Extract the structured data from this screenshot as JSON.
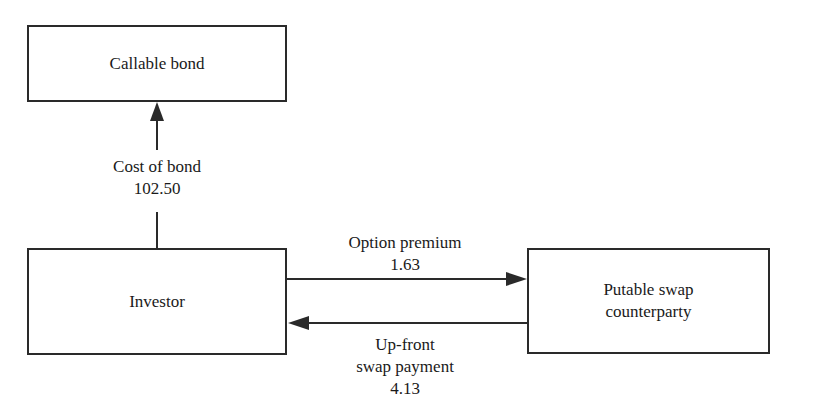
{
  "diagram": {
    "nodes": {
      "callable_bond": {
        "label": "Callable bond"
      },
      "investor": {
        "label": "Investor"
      },
      "putable_swap": {
        "label_line1": "Putable swap",
        "label_line2": "counterparty"
      }
    },
    "edges": {
      "cost_of_bond": {
        "from": "investor",
        "to": "callable_bond",
        "label": "Cost of bond",
        "value": "102.50"
      },
      "option_premium": {
        "from": "investor",
        "to": "putable_swap",
        "label": "Option premium",
        "value": "1.63"
      },
      "upfront_payment": {
        "from": "putable_swap",
        "to": "investor",
        "label_line1": "Up-front",
        "label_line2": "swap payment",
        "value": "4.13"
      }
    },
    "colors": {
      "line": "#2a2a2a",
      "background": "#ffffff",
      "text": "#1a1a1a"
    }
  }
}
